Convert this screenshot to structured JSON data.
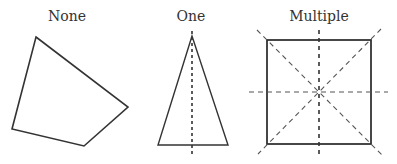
{
  "figure": {
    "panels": [
      {
        "title": "None",
        "shape": "irregular quadrilateral",
        "lines_of_symmetry": 0
      },
      {
        "title": "One",
        "shape": "isosceles triangle",
        "lines_of_symmetry": 1
      },
      {
        "title": "Multiple",
        "shape": "square",
        "lines_of_symmetry": 4
      }
    ]
  },
  "colors": {
    "stroke": "#333333",
    "background": "#ffffff"
  }
}
